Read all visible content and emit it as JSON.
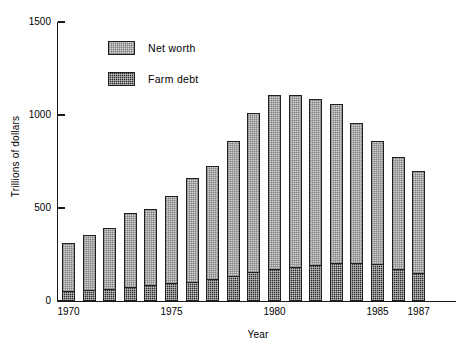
{
  "chart_data": {
    "type": "bar",
    "stacked": true,
    "title": "",
    "xlabel": "Year",
    "ylabel": "Trillions of dollars",
    "ylim": [
      0,
      1500
    ],
    "yticks": [
      0,
      500,
      1000,
      1500
    ],
    "ytick_labels": [
      "0",
      "500",
      "1000",
      "1500"
    ],
    "grid": false,
    "legend_position": "upper-left-inside",
    "categories": [
      "1970",
      "1971",
      "1972",
      "1973",
      "1974",
      "1975",
      "1976",
      "1977",
      "1978",
      "1979",
      "1980",
      "1981",
      "1982",
      "1983",
      "1984",
      "1985",
      "1986",
      "1987"
    ],
    "xtick_labels": [
      "1970",
      "1975",
      "1980",
      "1985",
      "1987"
    ],
    "xtick_categories": [
      "1970",
      "1975",
      "1980",
      "1985",
      "1987"
    ],
    "series": [
      {
        "name": "Farm debt",
        "color": "#2a2a2a",
        "values": [
          53,
          58,
          65,
          75,
          85,
          95,
          105,
          120,
          135,
          155,
          170,
          185,
          195,
          205,
          205,
          200,
          170,
          150
        ]
      },
      {
        "name": "Net worth",
        "color": "#d4d4d4",
        "values": [
          260,
          295,
          325,
          400,
          410,
          470,
          555,
          605,
          725,
          855,
          940,
          925,
          890,
          855,
          750,
          660,
          605,
          550
        ]
      }
    ],
    "totals": [
      313,
      353,
      390,
      475,
      495,
      565,
      660,
      725,
      860,
      1010,
      1110,
      1110,
      1085,
      1060,
      955,
      860,
      775,
      700
    ]
  },
  "legend": {
    "items": [
      {
        "label": "Net worth",
        "swatch": "net-worth-swatch"
      },
      {
        "label": "Farm debt",
        "swatch": "farm-debt-swatch"
      }
    ]
  },
  "axes": {
    "y": {
      "label": "Trillions of dollars"
    },
    "x": {
      "label": "Year"
    }
  }
}
